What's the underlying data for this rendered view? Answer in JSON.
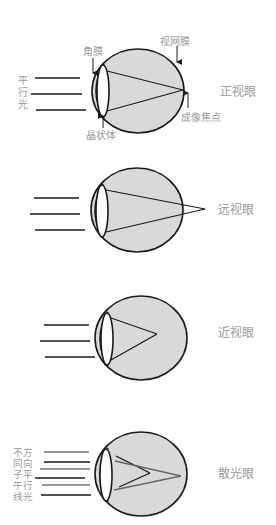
{
  "colors": {
    "eye_fill": "#d9d9d9",
    "stroke": "#1a1a1a",
    "label": "#9a9a9a",
    "background": "#ffffff",
    "astig_grey_ray": "#666666"
  },
  "panels": [
    {
      "id": "normal",
      "title": "正视眼",
      "side_label": [
        "平",
        "行",
        "光"
      ],
      "annotations": {
        "cornea": "角膜",
        "retina": "视网膜",
        "lens": "晶状体",
        "focal_point": "成像焦点"
      }
    },
    {
      "id": "hyperopia",
      "title": "远视眼"
    },
    {
      "id": "myopia",
      "title": "近视眼"
    },
    {
      "id": "astigmatism",
      "title": "散光眼",
      "side_label": [
        "不方",
        "同向",
        "子平",
        "午行",
        "线光"
      ]
    }
  ]
}
